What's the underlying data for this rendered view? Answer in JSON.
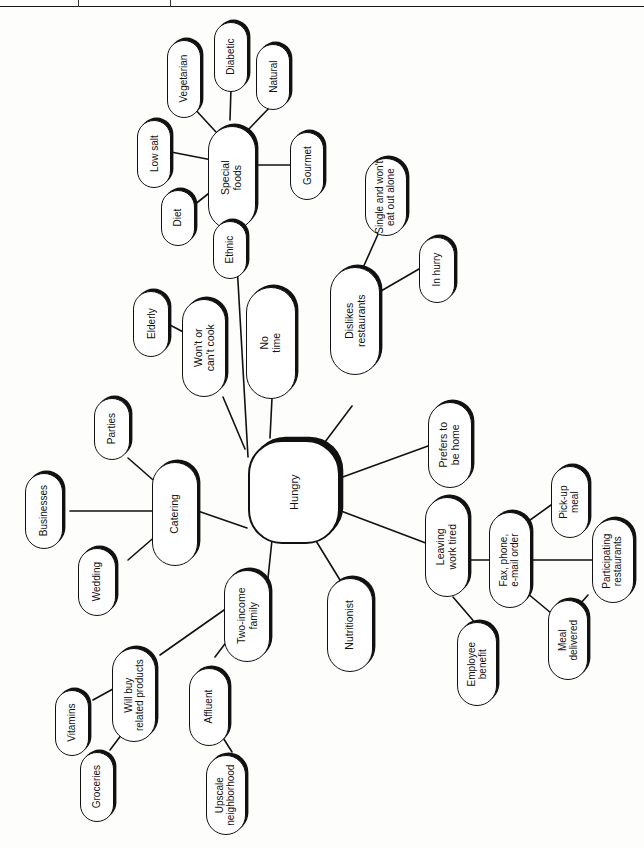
{
  "page": {
    "orientation": "rotated-90-ccw",
    "background_color": "#fdfdfc",
    "ink_color": "#111111"
  },
  "diagram": {
    "type": "mind-map",
    "root": "Hungry",
    "nodes": [
      {
        "id": "hungry",
        "label": "Hungry",
        "shape": "rounded-square",
        "level": 0
      },
      {
        "id": "special-foods",
        "label": "Special\nfoods",
        "shape": "pill",
        "level": 1
      },
      {
        "id": "vegetarian",
        "label": "Vegetarian",
        "shape": "pill",
        "level": 2
      },
      {
        "id": "diabetic",
        "label": "Diabetic",
        "shape": "pill",
        "level": 2
      },
      {
        "id": "natural",
        "label": "Natural",
        "shape": "pill",
        "level": 2
      },
      {
        "id": "low-salt",
        "label": "Low salt",
        "shape": "pill",
        "level": 2
      },
      {
        "id": "gourmet",
        "label": "Gourmet",
        "shape": "pill",
        "level": 2
      },
      {
        "id": "diet",
        "label": "Diet",
        "shape": "pill",
        "level": 2
      },
      {
        "id": "ethnic",
        "label": "Ethnic",
        "shape": "pill",
        "level": 2
      },
      {
        "id": "no-time",
        "label": "No\ntime",
        "shape": "pill",
        "level": 1
      },
      {
        "id": "dislikes-restaurants",
        "label": "Dislikes\nrestaurants",
        "shape": "pill",
        "level": 1
      },
      {
        "id": "single-wont-eat-out",
        "label": "Single and won't\neat out alone",
        "shape": "pill",
        "level": 2
      },
      {
        "id": "in-hurry",
        "label": "In hurry",
        "shape": "pill",
        "level": 2
      },
      {
        "id": "wont-cant-cook",
        "label": "Won't or\ncan't cook",
        "shape": "pill",
        "level": 1
      },
      {
        "id": "elderly",
        "label": "Elderly",
        "shape": "pill",
        "level": 2
      },
      {
        "id": "catering",
        "label": "Catering",
        "shape": "pill",
        "level": 1
      },
      {
        "id": "parties",
        "label": "Parties",
        "shape": "pill",
        "level": 2
      },
      {
        "id": "businesses",
        "label": "Businesses",
        "shape": "pill",
        "level": 2
      },
      {
        "id": "wedding",
        "label": "Wedding",
        "shape": "pill",
        "level": 2
      },
      {
        "id": "two-income-family",
        "label": "Two-income\nfamily",
        "shape": "pill",
        "level": 1
      },
      {
        "id": "will-buy-related",
        "label": "Will buy\nrelated products",
        "shape": "pill",
        "level": 2
      },
      {
        "id": "vitamins",
        "label": "Vitamins",
        "shape": "pill",
        "level": 3
      },
      {
        "id": "groceries",
        "label": "Groceries",
        "shape": "pill",
        "level": 3
      },
      {
        "id": "affluent",
        "label": "Affluent",
        "shape": "pill",
        "level": 2
      },
      {
        "id": "upscale-neighborhood",
        "label": "Upscale\nneighborhood",
        "shape": "pill",
        "level": 3
      },
      {
        "id": "nutritionist",
        "label": "Nutritionist",
        "shape": "pill",
        "level": 1
      },
      {
        "id": "prefers-be-home",
        "label": "Prefers to\nbe home",
        "shape": "pill",
        "level": 1
      },
      {
        "id": "leaving-work-tired",
        "label": "Leaving\nwork tired",
        "shape": "pill",
        "level": 1
      },
      {
        "id": "employee-benefit",
        "label": "Employee\nbenefit",
        "shape": "pill",
        "level": 2
      },
      {
        "id": "fax-phone-email",
        "label": "Fax, phone,\ne-mail order",
        "shape": "pill",
        "level": 2
      },
      {
        "id": "pick-up-meal",
        "label": "Pick-up\nmeal",
        "shape": "pill",
        "level": 3
      },
      {
        "id": "participating-restaurants",
        "label": "Participating\nrestaurants",
        "shape": "pill",
        "level": 3
      },
      {
        "id": "meal-delivered",
        "label": "Meal\ndelivered",
        "shape": "pill",
        "level": 3
      }
    ],
    "edges": [
      [
        "hungry",
        "special-foods"
      ],
      [
        "hungry",
        "no-time"
      ],
      [
        "hungry",
        "dislikes-restaurants"
      ],
      [
        "hungry",
        "wont-cant-cook"
      ],
      [
        "hungry",
        "catering"
      ],
      [
        "hungry",
        "two-income-family"
      ],
      [
        "hungry",
        "nutritionist"
      ],
      [
        "hungry",
        "prefers-be-home"
      ],
      [
        "hungry",
        "leaving-work-tired"
      ],
      [
        "special-foods",
        "vegetarian"
      ],
      [
        "special-foods",
        "diabetic"
      ],
      [
        "special-foods",
        "natural"
      ],
      [
        "special-foods",
        "low-salt"
      ],
      [
        "special-foods",
        "gourmet"
      ],
      [
        "special-foods",
        "diet"
      ],
      [
        "special-foods",
        "ethnic"
      ],
      [
        "dislikes-restaurants",
        "single-wont-eat-out"
      ],
      [
        "dislikes-restaurants",
        "in-hurry"
      ],
      [
        "wont-cant-cook",
        "elderly"
      ],
      [
        "catering",
        "parties"
      ],
      [
        "catering",
        "businesses"
      ],
      [
        "catering",
        "wedding"
      ],
      [
        "two-income-family",
        "will-buy-related"
      ],
      [
        "two-income-family",
        "affluent"
      ],
      [
        "will-buy-related",
        "vitamins"
      ],
      [
        "will-buy-related",
        "groceries"
      ],
      [
        "affluent",
        "upscale-neighborhood"
      ],
      [
        "leaving-work-tired",
        "employee-benefit"
      ],
      [
        "leaving-work-tired",
        "fax-phone-email"
      ],
      [
        "fax-phone-email",
        "pick-up-meal"
      ],
      [
        "fax-phone-email",
        "participating-restaurants"
      ],
      [
        "fax-phone-email",
        "meal-delivered"
      ],
      [
        "meal-delivered",
        "participating-restaurants"
      ]
    ]
  }
}
